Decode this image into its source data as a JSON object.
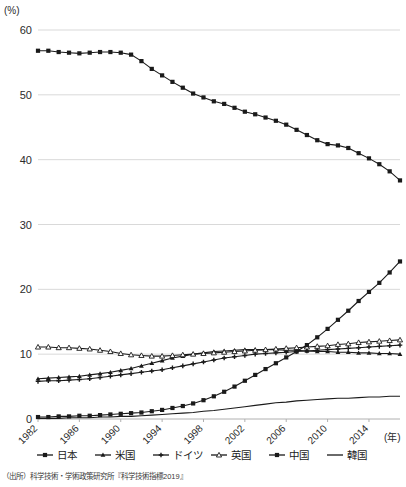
{
  "chart_data": {
    "type": "line",
    "title": "",
    "xlabel": "(年)",
    "ylabel": "(%)",
    "ylim": [
      0,
      60
    ],
    "xlim": [
      1982,
      2017
    ],
    "grid": true,
    "legend_position": "bottom",
    "ytick_labels": [
      "0",
      "10",
      "20",
      "30",
      "40",
      "50",
      "60"
    ],
    "ytick_values": [
      0,
      10,
      20,
      30,
      40,
      50,
      60
    ],
    "xtick_labels": [
      "1982",
      "1986",
      "1990",
      "1994",
      "1998",
      "2002",
      "2006",
      "2010",
      "2014"
    ],
    "xtick_values": [
      1982,
      1986,
      1990,
      1994,
      1998,
      2002,
      2006,
      2010,
      2014
    ],
    "x": [
      1982,
      1983,
      1984,
      1985,
      1986,
      1987,
      1988,
      1989,
      1990,
      1991,
      1992,
      1993,
      1994,
      1995,
      1996,
      1997,
      1998,
      1999,
      2000,
      2001,
      2002,
      2003,
      2004,
      2005,
      2006,
      2007,
      2008,
      2009,
      2010,
      2011,
      2012,
      2013,
      2014,
      2015,
      2016,
      2017
    ],
    "series": [
      {
        "name": "日本",
        "marker": "square-filled",
        "values": [
          56.8,
          56.8,
          56.6,
          56.5,
          56.4,
          56.5,
          56.6,
          56.6,
          56.5,
          56.2,
          55.2,
          54.0,
          53.0,
          52.0,
          51.1,
          50.2,
          49.6,
          49.0,
          48.6,
          48.0,
          47.4,
          47.0,
          46.5,
          46.0,
          45.4,
          44.6,
          43.8,
          43.0,
          42.4,
          42.2,
          41.8,
          41.0,
          40.2,
          39.3,
          38.2,
          36.8
        ]
      },
      {
        "name": "米国",
        "marker": "triangle-filled",
        "values": [
          6.2,
          6.3,
          6.4,
          6.5,
          6.6,
          6.8,
          7.0,
          7.2,
          7.5,
          7.8,
          8.2,
          8.6,
          9.0,
          9.4,
          9.7,
          10.0,
          10.2,
          10.4,
          10.5,
          10.6,
          10.7,
          10.7,
          10.7,
          10.7,
          10.6,
          10.6,
          10.5,
          10.4,
          10.4,
          10.3,
          10.3,
          10.2,
          10.2,
          10.1,
          10.1,
          10.0
        ]
      },
      {
        "name": "ドイツ",
        "marker": "plus-filled",
        "values": [
          5.8,
          5.9,
          5.9,
          6.0,
          6.1,
          6.2,
          6.4,
          6.6,
          6.8,
          7.0,
          7.2,
          7.4,
          7.6,
          7.9,
          8.2,
          8.5,
          8.8,
          9.1,
          9.4,
          9.6,
          9.8,
          10.0,
          10.1,
          10.2,
          10.3,
          10.4,
          10.5,
          10.6,
          10.7,
          10.8,
          10.9,
          11.0,
          11.1,
          11.2,
          11.3,
          11.4
        ]
      },
      {
        "name": "英国",
        "marker": "triangle-open",
        "values": [
          11.1,
          11.1,
          11.0,
          11.0,
          10.9,
          10.8,
          10.6,
          10.4,
          10.1,
          9.9,
          9.8,
          9.7,
          9.7,
          9.8,
          9.9,
          10.0,
          10.1,
          10.2,
          10.3,
          10.4,
          10.5,
          10.6,
          10.7,
          10.8,
          10.9,
          11.0,
          11.1,
          11.2,
          11.3,
          11.5,
          11.6,
          11.8,
          11.9,
          12.0,
          12.1,
          12.2
        ]
      },
      {
        "name": "中国",
        "marker": "square-filled",
        "values": [
          0.3,
          0.3,
          0.4,
          0.4,
          0.5,
          0.5,
          0.6,
          0.7,
          0.8,
          0.9,
          1.0,
          1.2,
          1.4,
          1.7,
          2.0,
          2.4,
          2.9,
          3.5,
          4.2,
          5.0,
          5.9,
          6.8,
          7.7,
          8.6,
          9.5,
          10.4,
          11.4,
          12.6,
          13.9,
          15.3,
          16.7,
          18.2,
          19.6,
          21.0,
          22.6,
          24.3
        ]
      },
      {
        "name": "韓国",
        "marker": "line-plain",
        "values": [
          0.1,
          0.1,
          0.1,
          0.2,
          0.2,
          0.2,
          0.3,
          0.3,
          0.4,
          0.4,
          0.5,
          0.6,
          0.7,
          0.8,
          0.9,
          1.0,
          1.2,
          1.3,
          1.5,
          1.7,
          1.9,
          2.1,
          2.3,
          2.5,
          2.6,
          2.8,
          2.9,
          3.0,
          3.1,
          3.2,
          3.2,
          3.3,
          3.4,
          3.4,
          3.5,
          3.5
        ]
      }
    ]
  },
  "source": {
    "note": "（出所）科学技術・学術政策研究所『科学技術指標2019』"
  }
}
